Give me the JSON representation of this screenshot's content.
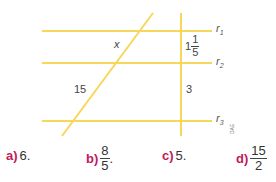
{
  "figure": {
    "line_color": "#f7d75a",
    "lines": {
      "r1": {
        "label_base": "r",
        "label_sub": "1"
      },
      "r2": {
        "label_base": "r",
        "label_sub": "2"
      },
      "r3": {
        "label_base": "r",
        "label_sub": "3"
      }
    },
    "segments": {
      "x_label": "x",
      "left_lower": "15",
      "right_upper_whole": "1",
      "right_upper_num": "1",
      "right_upper_den": "5",
      "right_lower": "3"
    },
    "credit": "DAE"
  },
  "options": [
    {
      "key": "a)",
      "value": "6."
    },
    {
      "key": "b)",
      "num": "8",
      "den": "5",
      "suffix": "."
    },
    {
      "key": "c)",
      "value": "5."
    },
    {
      "key": "d)",
      "num": "15",
      "den": "2"
    }
  ]
}
